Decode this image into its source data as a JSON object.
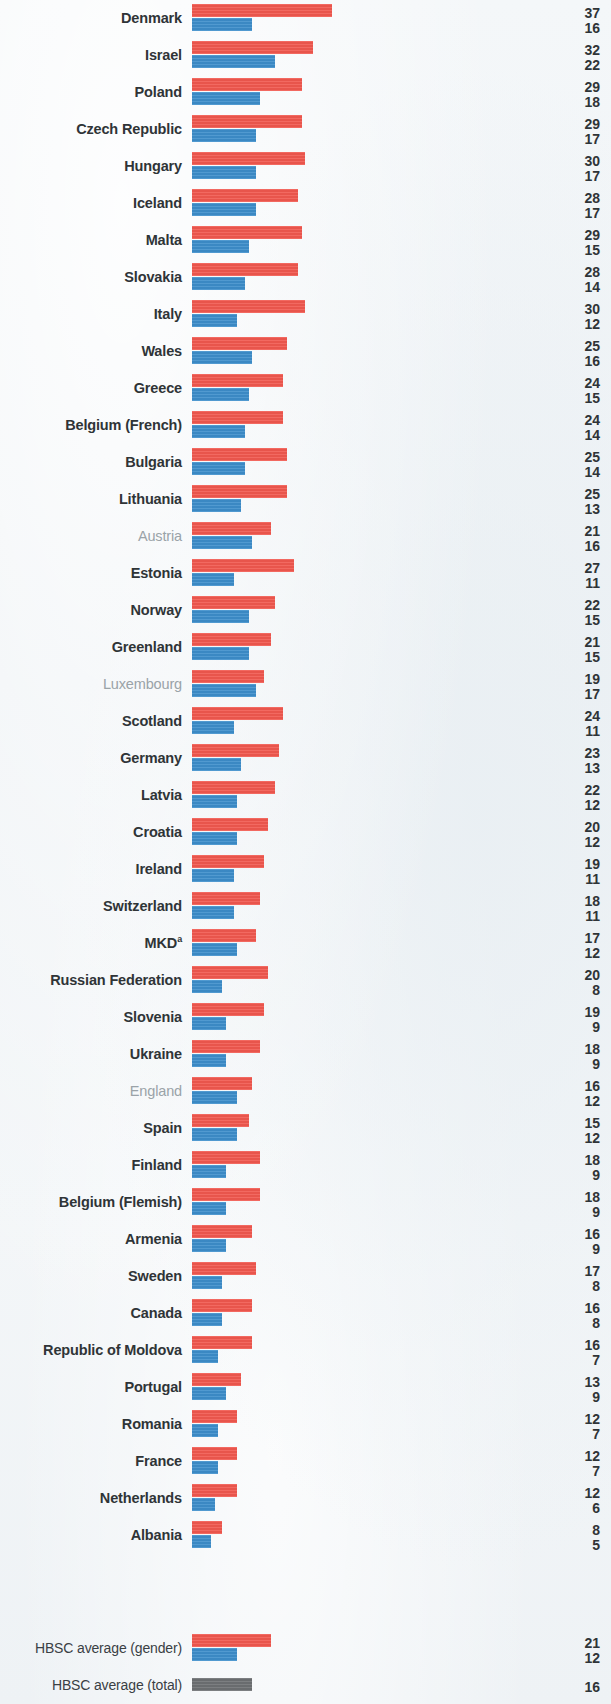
{
  "colors": {
    "boys": "#f1584f",
    "girls": "#3d8ecb",
    "total": "#6d7073",
    "background": "#f1f4f6",
    "label": "#2f3437",
    "label_muted": "#9aa3a8"
  },
  "layout": {
    "bar_origin_x": 192,
    "px_per_unit": 3.78,
    "row_height": 37,
    "first_row_top": 0,
    "average_block_top": 1630
  },
  "chart_data": {
    "type": "bar",
    "orientation": "horizontal",
    "title": "",
    "xlabel": "",
    "ylabel": "",
    "grid": false,
    "legend_position": "none",
    "series": [
      {
        "name": "boys",
        "color": "#f1584f"
      },
      {
        "name": "girls",
        "color": "#3d8ecb"
      }
    ],
    "categories": [
      "Denmark",
      "Israel",
      "Poland",
      "Czech Republic",
      "Hungary",
      "Iceland",
      "Malta",
      "Slovakia",
      "Italy",
      "Wales",
      "Greece",
      "Belgium (French)",
      "Bulgaria",
      "Lithuania",
      "Austria",
      "Estonia",
      "Norway",
      "Greenland",
      "Luxembourg",
      "Scotland",
      "Germany",
      "Latvia",
      "Croatia",
      "Ireland",
      "Switzerland",
      "MKD",
      "Russian Federation",
      "Slovenia",
      "Ukraine",
      "England",
      "Spain",
      "Finland",
      "Belgium (Flemish)",
      "Armenia",
      "Sweden",
      "Canada",
      "Republic of Moldova",
      "Portugal",
      "Romania",
      "France",
      "Netherlands",
      "Albania"
    ],
    "rows": [
      {
        "label": "Denmark",
        "muted": false,
        "sup": "",
        "top": 37,
        "bottom": 16
      },
      {
        "label": "Israel",
        "muted": false,
        "sup": "",
        "top": 32,
        "bottom": 22
      },
      {
        "label": "Poland",
        "muted": false,
        "sup": "",
        "top": 29,
        "bottom": 18
      },
      {
        "label": "Czech Republic",
        "muted": false,
        "sup": "",
        "top": 29,
        "bottom": 17
      },
      {
        "label": "Hungary",
        "muted": false,
        "sup": "",
        "top": 30,
        "bottom": 17
      },
      {
        "label": "Iceland",
        "muted": false,
        "sup": "",
        "top": 28,
        "bottom": 17
      },
      {
        "label": "Malta",
        "muted": false,
        "sup": "",
        "top": 29,
        "bottom": 15
      },
      {
        "label": "Slovakia",
        "muted": false,
        "sup": "",
        "top": 28,
        "bottom": 14
      },
      {
        "label": "Italy",
        "muted": false,
        "sup": "",
        "top": 30,
        "bottom": 12
      },
      {
        "label": "Wales",
        "muted": false,
        "sup": "",
        "top": 25,
        "bottom": 16
      },
      {
        "label": "Greece",
        "muted": false,
        "sup": "",
        "top": 24,
        "bottom": 15
      },
      {
        "label": "Belgium (French)",
        "muted": false,
        "sup": "",
        "top": 24,
        "bottom": 14
      },
      {
        "label": "Bulgaria",
        "muted": false,
        "sup": "",
        "top": 25,
        "bottom": 14
      },
      {
        "label": "Lithuania",
        "muted": false,
        "sup": "",
        "top": 25,
        "bottom": 13
      },
      {
        "label": "Austria",
        "muted": true,
        "sup": "",
        "top": 21,
        "bottom": 16
      },
      {
        "label": "Estonia",
        "muted": false,
        "sup": "",
        "top": 27,
        "bottom": 11
      },
      {
        "label": "Norway",
        "muted": false,
        "sup": "",
        "top": 22,
        "bottom": 15
      },
      {
        "label": "Greenland",
        "muted": false,
        "sup": "",
        "top": 21,
        "bottom": 15
      },
      {
        "label": "Luxembourg",
        "muted": true,
        "sup": "",
        "top": 19,
        "bottom": 17
      },
      {
        "label": "Scotland",
        "muted": false,
        "sup": "",
        "top": 24,
        "bottom": 11
      },
      {
        "label": "Germany",
        "muted": false,
        "sup": "",
        "top": 23,
        "bottom": 13
      },
      {
        "label": "Latvia",
        "muted": false,
        "sup": "",
        "top": 22,
        "bottom": 12
      },
      {
        "label": "Croatia",
        "muted": false,
        "sup": "",
        "top": 20,
        "bottom": 12
      },
      {
        "label": "Ireland",
        "muted": false,
        "sup": "",
        "top": 19,
        "bottom": 11
      },
      {
        "label": "Switzerland",
        "muted": false,
        "sup": "",
        "top": 18,
        "bottom": 11
      },
      {
        "label": "MKD",
        "muted": false,
        "sup": "a",
        "top": 17,
        "bottom": 12
      },
      {
        "label": "Russian Federation",
        "muted": false,
        "sup": "",
        "top": 20,
        "bottom": 8
      },
      {
        "label": "Slovenia",
        "muted": false,
        "sup": "",
        "top": 19,
        "bottom": 9
      },
      {
        "label": "Ukraine",
        "muted": false,
        "sup": "",
        "top": 18,
        "bottom": 9
      },
      {
        "label": "England",
        "muted": true,
        "sup": "",
        "top": 16,
        "bottom": 12
      },
      {
        "label": "Spain",
        "muted": false,
        "sup": "",
        "top": 15,
        "bottom": 12
      },
      {
        "label": "Finland",
        "muted": false,
        "sup": "",
        "top": 18,
        "bottom": 9
      },
      {
        "label": "Belgium (Flemish)",
        "muted": false,
        "sup": "",
        "top": 18,
        "bottom": 9
      },
      {
        "label": "Armenia",
        "muted": false,
        "sup": "",
        "top": 16,
        "bottom": 9
      },
      {
        "label": "Sweden",
        "muted": false,
        "sup": "",
        "top": 17,
        "bottom": 8
      },
      {
        "label": "Canada",
        "muted": false,
        "sup": "",
        "top": 16,
        "bottom": 8
      },
      {
        "label": "Republic of Moldova",
        "muted": false,
        "sup": "",
        "top": 16,
        "bottom": 7
      },
      {
        "label": "Portugal",
        "muted": false,
        "sup": "",
        "top": 13,
        "bottom": 9
      },
      {
        "label": "Romania",
        "muted": false,
        "sup": "",
        "top": 12,
        "bottom": 7
      },
      {
        "label": "France",
        "muted": false,
        "sup": "",
        "top": 12,
        "bottom": 7
      },
      {
        "label": "Netherlands",
        "muted": false,
        "sup": "",
        "top": 12,
        "bottom": 6
      },
      {
        "label": "Albania",
        "muted": false,
        "sup": "",
        "top": 8,
        "bottom": 5
      }
    ],
    "averages": [
      {
        "label": "HBSC average (gender)",
        "kind": "gender",
        "top": 21,
        "bottom": 12
      },
      {
        "label": "HBSC average (total)",
        "kind": "total",
        "total": 16
      }
    ]
  }
}
